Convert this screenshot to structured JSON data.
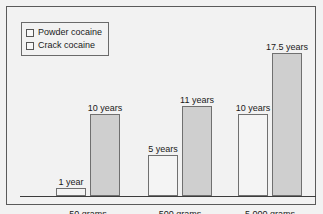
{
  "chart_data": {
    "type": "bar",
    "title": "",
    "subtitle": "",
    "xlabel": "",
    "ylabel": "",
    "ylim": [
      0,
      19
    ],
    "grid": false,
    "legend_position": "top-left",
    "categories": [
      "50 grams",
      "500 grams",
      "5,000 grams"
    ],
    "series": [
      {
        "name": "Powder cocaine",
        "color": "#f4f4f4",
        "values": [
          1,
          5,
          10
        ],
        "value_labels": [
          "1 year",
          "5 years",
          "10 years"
        ]
      },
      {
        "name": "Crack cocaine",
        "color": "#cfcfcf",
        "values": [
          10,
          11,
          17.5
        ],
        "value_labels": [
          "10 years",
          "11 years",
          "17.5 years"
        ]
      }
    ]
  },
  "legend": {
    "items": [
      {
        "label": "Powder cocaine",
        "swatch": "powder"
      },
      {
        "label": "Crack cocaine",
        "swatch": "crack"
      }
    ]
  },
  "colors": {
    "background": "#f2f2f2",
    "frame": "#5a5a5a",
    "axis": "#3c3c3c",
    "bar_outline": "#707070",
    "powder_fill": "#f4f4f4",
    "crack_fill": "#cfcfcf",
    "text": "#1a1a1a"
  }
}
